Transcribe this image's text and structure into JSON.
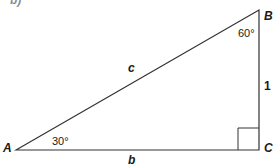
{
  "diagram": {
    "type": "right-triangle",
    "partial_label_top_left": "b)",
    "vertices": [
      {
        "name": "A",
        "x": 16,
        "y": 150
      },
      {
        "name": "B",
        "x": 259,
        "y": 10
      },
      {
        "name": "C",
        "x": 259,
        "y": 150
      }
    ],
    "sides": {
      "hypotenuse": "c",
      "base": "b",
      "vertical": "1"
    },
    "angles": {
      "A": "30°",
      "B": "60°",
      "C": "right-angle"
    },
    "colors": {
      "line": "#333333",
      "text": "#1a1a1a",
      "background": "#ffffff"
    }
  }
}
